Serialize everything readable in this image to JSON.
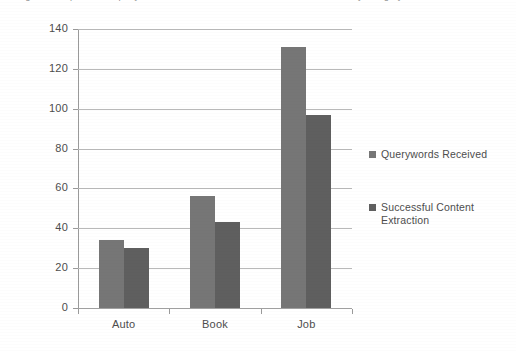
{
  "caption": {
    "text": "Figure: Comparison of querywords received and successful content extraction by category"
  },
  "chart_data": {
    "type": "bar",
    "title": "",
    "subtitle": "",
    "xlabel": "",
    "ylabel": "",
    "categories": [
      "Auto",
      "Book",
      "Job"
    ],
    "series": [
      {
        "name": "Querywords Received",
        "values": [
          34,
          56,
          131
        ],
        "color": "#767676"
      },
      {
        "name": "Successful Content Extraction",
        "values": [
          30,
          43,
          97
        ],
        "color": "#5f5f5f"
      }
    ],
    "ylim": [
      0,
      140
    ],
    "ytick_step": 20,
    "yticks": [
      0,
      20,
      40,
      60,
      80,
      100,
      120,
      140
    ],
    "ytick_labels": [
      "0",
      "20",
      "40",
      "60",
      "80",
      "100",
      "120",
      "140"
    ],
    "grid": true,
    "grid_axis": "y",
    "legend": true,
    "legend_position": "right",
    "legend_entries": [
      "Querywords Received",
      "Successful Content Extraction"
    ],
    "background_color": "#ffffff",
    "gridline_color": "#b9b9b9",
    "axis_color": "#9a9a9a"
  }
}
